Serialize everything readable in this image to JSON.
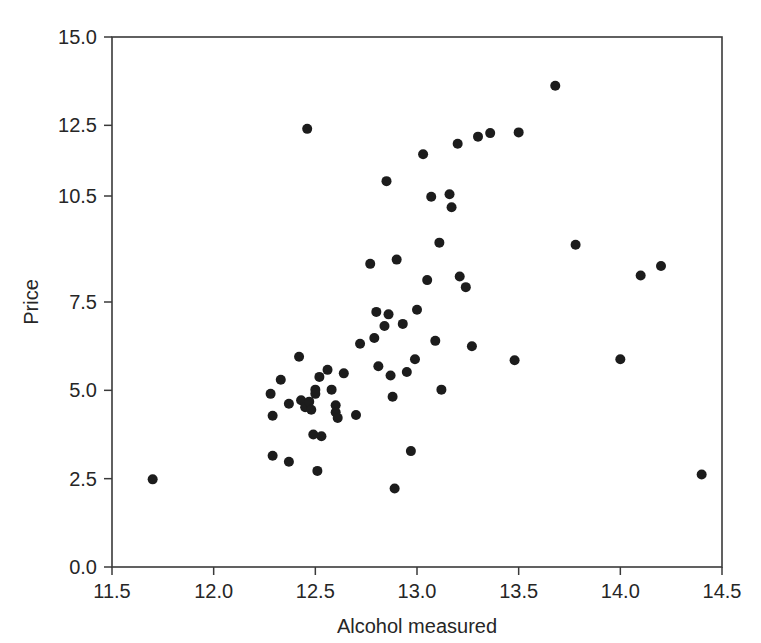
{
  "figure": {
    "background_color": "#ffffff",
    "frame_color": "#3a3a3a",
    "point_color": "#1c1c1c"
  },
  "chart_data": {
    "type": "scatter",
    "title": "",
    "xlabel": "Alcohol measured",
    "ylabel": "Price",
    "xlim": [
      11.5,
      14.5
    ],
    "ylim": [
      0.0,
      15.0
    ],
    "xticks": [
      11.5,
      12.0,
      12.5,
      13.0,
      13.5,
      14.0,
      14.5
    ],
    "xticklabels": [
      "11.5",
      "12.0",
      "12.5",
      "13.0",
      "13.5",
      "14.0",
      "14.5"
    ],
    "yticks": [
      0.0,
      2.5,
      5.0,
      7.5,
      10.5,
      12.5,
      15.0
    ],
    "yticklabels": [
      "0.0",
      "2.5",
      "5.0",
      "7.5",
      "10.5",
      "12.5",
      "15.0"
    ],
    "grid": false,
    "legend": null,
    "marker": "circle",
    "marker_size": 5,
    "n_points": 63,
    "x": [
      11.7,
      12.28,
      12.29,
      12.29,
      12.3,
      12.33,
      12.37,
      12.37,
      12.42,
      12.43,
      12.45,
      12.46,
      12.47,
      12.48,
      12.49,
      12.5,
      12.5,
      12.51,
      12.52,
      12.53,
      12.56,
      12.58,
      12.6,
      12.6,
      12.61,
      12.64,
      12.7,
      12.72,
      12.77,
      12.79,
      12.8,
      12.81,
      12.84,
      12.85,
      12.86,
      12.87,
      12.88,
      12.89,
      12.9,
      12.93,
      12.95,
      12.97,
      12.99,
      13.0,
      13.03,
      13.05,
      13.07,
      13.09,
      13.11,
      13.12,
      13.16,
      13.17,
      13.2,
      13.21,
      13.24,
      13.27,
      13.3,
      13.36,
      13.48,
      13.5,
      13.68,
      13.78,
      14.0,
      14.1,
      14.2,
      14.4
    ],
    "y": [
      2.48,
      4.9,
      4.28,
      3.15,
      4.12,
      5.3,
      4.62,
      2.98,
      5.95,
      4.72,
      4.52,
      12.4,
      4.68,
      4.45,
      3.75,
      5.02,
      4.9,
      2.72,
      5.38,
      3.7,
      5.58,
      5.02,
      4.58,
      4.38,
      4.22,
      5.48,
      4.3,
      6.32,
      8.58,
      6.48,
      7.22,
      5.68,
      6.82,
      10.92,
      7.15,
      5.42,
      4.82,
      2.22,
      8.7,
      6.88,
      5.52,
      3.28,
      5.88,
      7.28,
      11.68,
      8.12,
      10.48,
      6.4,
      9.18,
      5.02,
      10.55,
      10.18,
      11.98,
      8.22,
      7.92,
      6.25,
      12.18,
      12.28,
      5.85,
      12.3,
      13.62,
      9.12,
      5.88,
      8.25,
      8.52,
      2.62
    ],
    "points": [
      {
        "x": 11.7,
        "y": 2.48
      },
      {
        "x": 12.28,
        "y": 4.9
      },
      {
        "x": 12.29,
        "y": 4.28
      },
      {
        "x": 12.29,
        "y": 3.15
      },
      {
        "x": 12.33,
        "y": 5.3
      },
      {
        "x": 12.37,
        "y": 4.62
      },
      {
        "x": 12.37,
        "y": 2.98
      },
      {
        "x": 12.42,
        "y": 5.95
      },
      {
        "x": 12.43,
        "y": 4.72
      },
      {
        "x": 12.45,
        "y": 4.52
      },
      {
        "x": 12.46,
        "y": 12.4
      },
      {
        "x": 12.47,
        "y": 4.68
      },
      {
        "x": 12.48,
        "y": 4.45
      },
      {
        "x": 12.49,
        "y": 3.75
      },
      {
        "x": 12.5,
        "y": 5.02
      },
      {
        "x": 12.5,
        "y": 4.9
      },
      {
        "x": 12.51,
        "y": 2.72
      },
      {
        "x": 12.52,
        "y": 5.38
      },
      {
        "x": 12.53,
        "y": 3.7
      },
      {
        "x": 12.56,
        "y": 5.58
      },
      {
        "x": 12.58,
        "y": 5.02
      },
      {
        "x": 12.6,
        "y": 4.58
      },
      {
        "x": 12.6,
        "y": 4.38
      },
      {
        "x": 12.61,
        "y": 4.22
      },
      {
        "x": 12.64,
        "y": 5.48
      },
      {
        "x": 12.7,
        "y": 4.3
      },
      {
        "x": 12.72,
        "y": 6.32
      },
      {
        "x": 12.77,
        "y": 8.58
      },
      {
        "x": 12.79,
        "y": 6.48
      },
      {
        "x": 12.8,
        "y": 7.22
      },
      {
        "x": 12.81,
        "y": 5.68
      },
      {
        "x": 12.84,
        "y": 6.82
      },
      {
        "x": 12.85,
        "y": 10.92
      },
      {
        "x": 12.86,
        "y": 7.15
      },
      {
        "x": 12.87,
        "y": 5.42
      },
      {
        "x": 12.88,
        "y": 4.82
      },
      {
        "x": 12.89,
        "y": 2.22
      },
      {
        "x": 12.9,
        "y": 8.7
      },
      {
        "x": 12.93,
        "y": 6.88
      },
      {
        "x": 12.95,
        "y": 5.52
      },
      {
        "x": 12.97,
        "y": 3.28
      },
      {
        "x": 12.99,
        "y": 5.88
      },
      {
        "x": 13.0,
        "y": 7.28
      },
      {
        "x": 13.03,
        "y": 11.68
      },
      {
        "x": 13.05,
        "y": 8.12
      },
      {
        "x": 13.07,
        "y": 10.48
      },
      {
        "x": 13.09,
        "y": 6.4
      },
      {
        "x": 13.11,
        "y": 9.18
      },
      {
        "x": 13.12,
        "y": 5.02
      },
      {
        "x": 13.16,
        "y": 10.55
      },
      {
        "x": 13.17,
        "y": 10.18
      },
      {
        "x": 13.2,
        "y": 11.98
      },
      {
        "x": 13.21,
        "y": 8.22
      },
      {
        "x": 13.24,
        "y": 7.92
      },
      {
        "x": 13.27,
        "y": 6.25
      },
      {
        "x": 13.3,
        "y": 12.18
      },
      {
        "x": 13.36,
        "y": 12.28
      },
      {
        "x": 13.48,
        "y": 5.85
      },
      {
        "x": 13.5,
        "y": 12.3
      },
      {
        "x": 13.68,
        "y": 13.62
      },
      {
        "x": 13.78,
        "y": 9.12
      },
      {
        "x": 14.0,
        "y": 5.88
      },
      {
        "x": 14.1,
        "y": 8.25
      },
      {
        "x": 14.2,
        "y": 8.52
      },
      {
        "x": 14.4,
        "y": 2.62
      }
    ]
  }
}
